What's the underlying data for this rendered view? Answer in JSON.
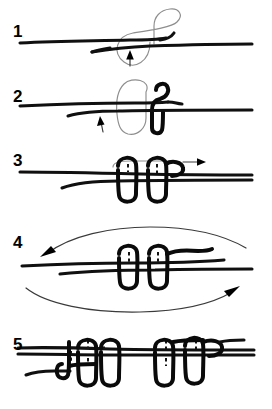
{
  "document": {
    "title": "Knot tying instruction diagram",
    "kind": "five-step hand-drawn knot sequence",
    "background_color": "#ffffff",
    "ink_color": "#101010",
    "ghost_color": "#8e8e8e",
    "width": 272,
    "height": 409
  },
  "steps": [
    {
      "number": "1",
      "label_x": 13,
      "label_y": 23,
      "caption": "Single line with a loop formed over it; arrow shows the working end passing up under the standing line",
      "icons": [
        "up-arrow-icon",
        "ghost-loop-icon"
      ]
    },
    {
      "number": "2",
      "label_x": 13,
      "label_y": 88,
      "caption": "Working end wrapped once around the standing part forming the first coil; arrow shows direction of further wraps",
      "icons": [
        "up-arrow-icon",
        "ghost-loop-icon"
      ]
    },
    {
      "number": "3",
      "label_x": 13,
      "label_y": 155,
      "caption": "Two coils completed; arrow at the right shows the end being fed back through the coils",
      "icons": [
        "right-arrow-icon"
      ]
    },
    {
      "number": "4",
      "label_x": 13,
      "label_y": 234,
      "caption": "Tighten by pulling both ends in opposite directions; left arrow and right arrow show the pull",
      "icons": [
        "left-arrow-icon",
        "right-arrow-icon"
      ]
    },
    {
      "number": "5",
      "label_x": 13,
      "label_y": 336,
      "caption": "Completed double knot with two mirrored coil groups drawn together on the line",
      "icons": []
    }
  ]
}
